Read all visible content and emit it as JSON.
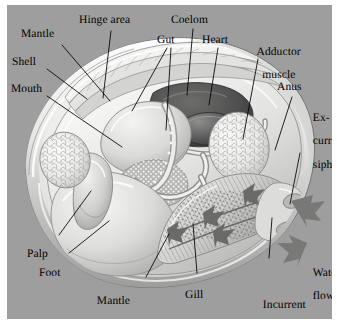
{
  "figure": {
    "background_color": "#9e9e9e",
    "panel_color": "#9e9e9e",
    "outer_color": "#ffffff",
    "line_color": "#000000",
    "arrow_color": "#6f6f6f"
  },
  "labels": [
    {
      "id": "mantle",
      "text": "Mantle",
      "lines": [
        "Mantle"
      ]
    },
    {
      "id": "hinge-area",
      "text": "Hinge area",
      "lines": [
        "Hinge area"
      ]
    },
    {
      "id": "shell",
      "text": "Shell",
      "lines": [
        "Shell"
      ]
    },
    {
      "id": "mouth",
      "text": "Mouth",
      "lines": [
        "Mouth"
      ]
    },
    {
      "id": "gut",
      "text": "Gut",
      "lines": [
        "Gut"
      ]
    },
    {
      "id": "coelom",
      "text": "Coelom",
      "lines": [
        "Coelom"
      ]
    },
    {
      "id": "heart",
      "text": "Heart",
      "lines": [
        "Heart"
      ]
    },
    {
      "id": "adductor-muscle",
      "text": "Adductor muscle",
      "lines": [
        "Adductor",
        "muscle"
      ]
    },
    {
      "id": "anus",
      "text": "Anus",
      "lines": [
        "Anus"
      ]
    },
    {
      "id": "excurrent-siphon",
      "text": "Ex-current siphon",
      "lines": [
        "Ex-",
        "current",
        "siphon"
      ]
    },
    {
      "id": "water-flow",
      "text": "Water flow",
      "lines": [
        "Water",
        "flow"
      ]
    },
    {
      "id": "incurrent-siphon",
      "text": "Incurrent siphon",
      "lines": [
        "Incurrent",
        "siphon"
      ]
    },
    {
      "id": "gill",
      "text": "Gill",
      "lines": [
        "Gill"
      ]
    },
    {
      "id": "mantle-cavity",
      "text": "Mantle cavity",
      "lines": [
        "Mantle",
        "cavity"
      ]
    },
    {
      "id": "foot",
      "text": "Foot",
      "lines": [
        "Foot"
      ]
    },
    {
      "id": "palp",
      "text": "Palp",
      "lines": [
        "Palp"
      ]
    }
  ],
  "structures": [
    {
      "id": "shell-valve",
      "name": "shell-valve"
    },
    {
      "id": "mantle-fold",
      "name": "mantle-fold"
    },
    {
      "id": "hinge-ridges",
      "name": "hinge-ridges"
    },
    {
      "id": "anterior-adductor",
      "name": "anterior-adductor-muscle"
    },
    {
      "id": "posterior-adductor",
      "name": "posterior-adductor-muscle"
    },
    {
      "id": "coelom-cavity",
      "name": "coelom-cavity"
    },
    {
      "id": "heart-organ",
      "name": "heart"
    },
    {
      "id": "stomach-mass",
      "name": "stomach-visceral-mass"
    },
    {
      "id": "intestine-coil",
      "name": "coiled-intestine"
    },
    {
      "id": "digestive-gland",
      "name": "digestive-gland"
    },
    {
      "id": "foot-mass",
      "name": "foot"
    },
    {
      "id": "labial-palp",
      "name": "labial-palp"
    },
    {
      "id": "gill-lamellae",
      "name": "gill-lamellae"
    },
    {
      "id": "excurrent-opening",
      "name": "excurrent-siphon-opening"
    },
    {
      "id": "incurrent-opening",
      "name": "incurrent-siphon-opening"
    }
  ],
  "flow_arrows": [
    {
      "id": "arrow-excurrent-out",
      "direction": "right",
      "meaning": "excurrent water flow out"
    },
    {
      "id": "arrow-incurrent-in",
      "direction": "left",
      "meaning": "incurrent water flow in"
    },
    {
      "id": "arrow-gill-1",
      "direction": "left",
      "meaning": "water over gill"
    },
    {
      "id": "arrow-gill-2",
      "direction": "left",
      "meaning": "water over gill"
    },
    {
      "id": "arrow-gill-3",
      "direction": "left",
      "meaning": "water over gill"
    },
    {
      "id": "arrow-mantle-flow",
      "direction": "left",
      "meaning": "water through mantle cavity"
    }
  ]
}
